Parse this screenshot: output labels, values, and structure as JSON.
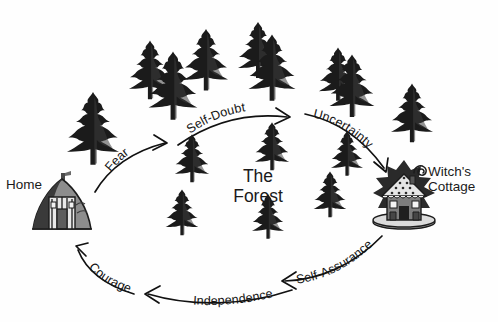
{
  "diagram": {
    "title_present": false,
    "background_color": "#fefefe",
    "ink_color": "#111111",
    "nodes": [
      {
        "id": "home",
        "label": "Home",
        "icon": "cottage-house-icon",
        "x": 62,
        "y": 205
      },
      {
        "id": "forest",
        "label": "The\nForest",
        "icon": "forest-center-icon",
        "x": 258,
        "y": 185
      },
      {
        "id": "witch",
        "label": "Witch's\nCottage",
        "icon": "gingerbread-cottage-icon",
        "x": 404,
        "y": 198
      }
    ],
    "arrows": [
      {
        "id": "fear",
        "label": "Fear",
        "from": "home",
        "to": "forest-entry",
        "direction": "up-right"
      },
      {
        "id": "self-doubt",
        "label": "Self-Doubt",
        "from": "forest-entry",
        "to": "forest-upper",
        "direction": "right"
      },
      {
        "id": "uncertainty",
        "label": "Uncertainty",
        "from": "forest-upper",
        "to": "witch",
        "direction": "down-right"
      },
      {
        "id": "self-assurance",
        "label": "Self-Assurance",
        "from": "witch",
        "to": "lower-right",
        "direction": "down-left"
      },
      {
        "id": "independence",
        "label": "Independence",
        "from": "lower-right",
        "to": "lower-left",
        "direction": "left"
      },
      {
        "id": "courage",
        "label": "Courage",
        "from": "lower-left",
        "to": "home",
        "direction": "up-left"
      }
    ],
    "trees": [
      {
        "x": 93,
        "y": 131,
        "s": 1.3
      },
      {
        "x": 150,
        "y": 72,
        "s": 1.05
      },
      {
        "x": 173,
        "y": 88,
        "s": 1.22
      },
      {
        "x": 206,
        "y": 62,
        "s": 1.1
      },
      {
        "x": 258,
        "y": 52,
        "s": 1.0
      },
      {
        "x": 272,
        "y": 70,
        "s": 1.18
      },
      {
        "x": 338,
        "y": 76,
        "s": 0.95
      },
      {
        "x": 352,
        "y": 88,
        "s": 1.12
      },
      {
        "x": 412,
        "y": 115,
        "s": 1.05
      },
      {
        "x": 192,
        "y": 160,
        "s": 0.86
      },
      {
        "x": 182,
        "y": 214,
        "s": 0.82
      },
      {
        "x": 272,
        "y": 148,
        "s": 0.86
      },
      {
        "x": 268,
        "y": 218,
        "s": 0.8
      },
      {
        "x": 330,
        "y": 196,
        "s": 0.82
      },
      {
        "x": 347,
        "y": 155,
        "s": 0.8
      }
    ]
  }
}
